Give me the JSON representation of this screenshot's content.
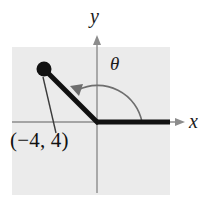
{
  "figure": {
    "background_color": "#ffffff",
    "panel_color": "#ebebeb",
    "panel": {
      "x": 12,
      "y": 47,
      "width": 158,
      "height": 148
    },
    "axis_color": "#8c8c8c",
    "ray_color": "#111111",
    "arc_color": "#6e6e6e",
    "leader_color": "#3b3b3b"
  },
  "axes": {
    "origin": {
      "x": 97,
      "y": 122
    },
    "x_label": "x",
    "y_label": "y",
    "x_axis": {
      "x1": 12,
      "y1": 122,
      "x2": 185,
      "y2": 122
    },
    "y_axis": {
      "x1": 97,
      "y1": 35,
      "x2": 97,
      "y2": 193
    }
  },
  "angle": {
    "symbol": "θ",
    "measure_degrees": 135,
    "arc_radius": 45,
    "direction": "counterclockwise",
    "initial_side": {
      "from": {
        "x": 97,
        "y": 122
      },
      "to": {
        "x": 170,
        "y": 122
      }
    },
    "terminal_side": {
      "from": {
        "x": 97,
        "y": 122
      },
      "to": {
        "x": 44,
        "y": 69
      }
    }
  },
  "point": {
    "label": "(−4, 4)",
    "coordinates": {
      "x": -4,
      "y": 4
    },
    "marker": {
      "cx": 44,
      "cy": 69,
      "r": 7
    },
    "leader_line": {
      "x1": 43,
      "y1": 77,
      "x2": 56,
      "y2": 133
    }
  }
}
